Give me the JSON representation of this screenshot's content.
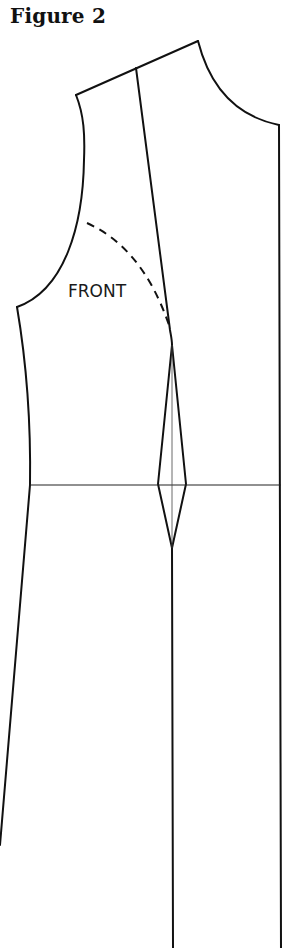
{
  "figure": {
    "title": "Figure 2",
    "piece_label": "FRONT"
  },
  "colors": {
    "line": "#111111",
    "background": "#ffffff"
  },
  "diagram": {
    "type": "sewing-pattern",
    "piece": "bodice front with waist dart",
    "elements": [
      "shoulder-line",
      "neckline-curve",
      "center-front-line",
      "armhole-curve",
      "side-seam",
      "guide-line",
      "dashed-armhole-reference",
      "waistline",
      "waist-dart",
      "dart-center-line",
      "lower-center-line"
    ]
  }
}
